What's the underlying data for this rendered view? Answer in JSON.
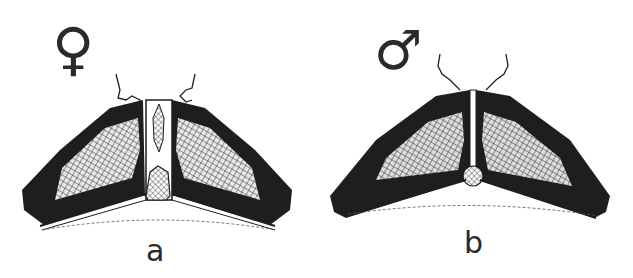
{
  "figure": {
    "panels": [
      {
        "label": "a",
        "sex_symbol": "♀",
        "sex": "female"
      },
      {
        "label": "b",
        "sex_symbol": "♂",
        "sex": "male"
      }
    ]
  },
  "colors": {
    "ink": "#1e1e1e",
    "background": "#ffffff",
    "hatch": "#555555"
  }
}
